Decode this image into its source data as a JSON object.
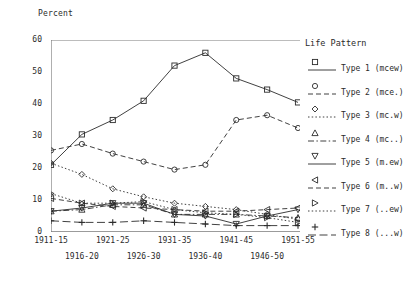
{
  "chart_data": {
    "type": "line",
    "title": "",
    "ylabel": "Percent",
    "xlabel": "",
    "ylim": [
      0,
      60
    ],
    "yticks": [
      0,
      10,
      20,
      30,
      40,
      50,
      60
    ],
    "grid": false,
    "legend_position": "right",
    "legend_title": "Life Pattern",
    "categories": [
      "1911-15",
      "1916-20",
      "1921-25",
      "1926-30",
      "1931-35",
      "1936-40",
      "1941-45",
      "1946-50",
      "1951-55"
    ],
    "series": [
      {
        "name": "Type 1 (mcew)",
        "marker": "square",
        "linestyle": "solid",
        "values": [
          21,
          30.5,
          35,
          41,
          52,
          56,
          48,
          44.5,
          40.5
        ]
      },
      {
        "name": "Type 2 (mce.)",
        "marker": "circle",
        "linestyle": "dashed",
        "values": [
          25.5,
          27.5,
          24.5,
          22,
          19.5,
          21,
          35,
          36.5,
          32.5
        ]
      },
      {
        "name": "Type 3 (mc.w)",
        "marker": "diamond",
        "linestyle": "dotted",
        "values": [
          21.5,
          18,
          13.5,
          11,
          9,
          8,
          7,
          5.5,
          4
        ]
      },
      {
        "name": "Type 4 (mc..)",
        "marker": "triangle-up",
        "linestyle": "dash-dot",
        "values": [
          6.5,
          7,
          8.5,
          8.5,
          5.5,
          5.5,
          5.5,
          5,
          4.5
        ]
      },
      {
        "name": "Type 5 (m.ew)",
        "marker": "triangle-down",
        "linestyle": "solid",
        "values": [
          6.5,
          7.5,
          9,
          9,
          5.5,
          5,
          2.5,
          5,
          7
        ]
      },
      {
        "name": "Type 6 (m..w)",
        "marker": "triangle-left",
        "linestyle": "dashed",
        "values": [
          10.5,
          9,
          8,
          7.5,
          7,
          6.5,
          6.5,
          7,
          7.5
        ]
      },
      {
        "name": "Type 7 (..ew)",
        "marker": "triangle-right",
        "linestyle": "dotted",
        "values": [
          12,
          9,
          9,
          9.5,
          7,
          6,
          5.5,
          4.5,
          3
        ]
      },
      {
        "name": "Type 8 (...w)",
        "marker": "plus",
        "linestyle": "long-dash",
        "values": [
          3.5,
          3,
          3,
          3.5,
          3,
          2.5,
          2,
          2,
          2
        ]
      }
    ]
  },
  "legend": {
    "title": "Life Pattern",
    "items": [
      {
        "label": "Type 1 (mcew)"
      },
      {
        "label": "Type 2 (mce.)"
      },
      {
        "label": "Type 3 (mc.w)"
      },
      {
        "label": "Type 4 (mc..)"
      },
      {
        "label": "Type 5 (m.ew)"
      },
      {
        "label": "Type 6 (m..w)"
      },
      {
        "label": "Type 7 (..ew)"
      },
      {
        "label": "Type 8 (...w)"
      }
    ]
  },
  "colors": {
    "ink": "#2b2b2b",
    "axis": "#7a7a7a",
    "background": "#ffffff"
  }
}
